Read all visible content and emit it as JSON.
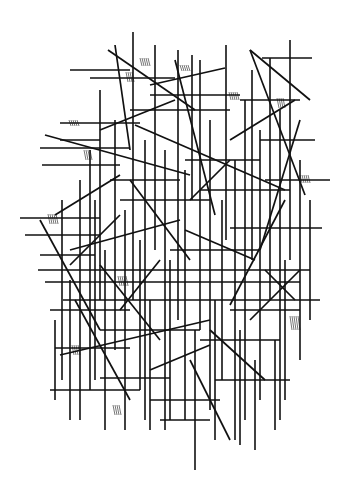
{
  "artwork": {
    "title": "Abstract line drawing",
    "background": "#ffffff",
    "ink": "#111111",
    "hatch": "#555555",
    "width": 347,
    "height": 489,
    "verticals": [
      [
        133,
        32,
        133,
        300
      ],
      [
        155,
        45,
        155,
        250
      ],
      [
        178,
        50,
        178,
        320
      ],
      [
        192,
        55,
        192,
        200
      ],
      [
        200,
        60,
        200,
        330
      ],
      [
        226,
        45,
        226,
        240
      ],
      [
        252,
        70,
        252,
        260
      ],
      [
        270,
        58,
        270,
        300
      ],
      [
        290,
        40,
        290,
        260
      ],
      [
        100,
        90,
        100,
        300
      ],
      [
        115,
        120,
        115,
        350
      ],
      [
        90,
        150,
        90,
        390
      ],
      [
        80,
        180,
        80,
        420
      ],
      [
        62,
        200,
        62,
        380
      ],
      [
        145,
        140,
        145,
        420
      ],
      [
        165,
        150,
        165,
        430
      ],
      [
        185,
        170,
        185,
        420
      ],
      [
        210,
        120,
        210,
        410
      ],
      [
        235,
        160,
        235,
        440
      ],
      [
        245,
        100,
        245,
        420
      ],
      [
        260,
        130,
        260,
        400
      ],
      [
        280,
        110,
        280,
        420
      ],
      [
        300,
        160,
        300,
        360
      ],
      [
        310,
        200,
        310,
        320
      ],
      [
        125,
        210,
        125,
        430
      ],
      [
        105,
        250,
        105,
        430
      ],
      [
        70,
        280,
        70,
        420
      ],
      [
        55,
        320,
        55,
        400
      ],
      [
        215,
        300,
        215,
        440
      ],
      [
        195,
        330,
        195,
        470
      ],
      [
        240,
        330,
        240,
        445
      ],
      [
        275,
        340,
        275,
        430
      ],
      [
        255,
        360,
        255,
        450
      ],
      [
        150,
        300,
        150,
        430
      ],
      [
        170,
        260,
        170,
        420
      ],
      [
        222,
        200,
        222,
        380
      ],
      [
        95,
        200,
        95,
        380
      ],
      [
        140,
        240,
        140,
        390
      ],
      [
        285,
        260,
        285,
        400
      ]
    ],
    "horizontals": [
      [
        70,
        70,
        130,
        70
      ],
      [
        90,
        78,
        175,
        78
      ],
      [
        262,
        58,
        312,
        58
      ],
      [
        40,
        148,
        130,
        148
      ],
      [
        42,
        165,
        120,
        165
      ],
      [
        60,
        123,
        140,
        123
      ],
      [
        60,
        140,
        100,
        140
      ],
      [
        260,
        140,
        315,
        140
      ],
      [
        265,
        180,
        330,
        180
      ],
      [
        20,
        218,
        100,
        218
      ],
      [
        25,
        235,
        100,
        235
      ],
      [
        230,
        228,
        322,
        228
      ],
      [
        40,
        255,
        95,
        255
      ],
      [
        38,
        270,
        310,
        270
      ],
      [
        45,
        282,
        300,
        282
      ],
      [
        63,
        300,
        320,
        300
      ],
      [
        50,
        310,
        130,
        310
      ],
      [
        55,
        348,
        130,
        348
      ],
      [
        100,
        378,
        170,
        378
      ],
      [
        150,
        400,
        220,
        400
      ],
      [
        170,
        250,
        260,
        250
      ],
      [
        120,
        200,
        210,
        200
      ],
      [
        200,
        190,
        290,
        190
      ],
      [
        130,
        110,
        230,
        110
      ],
      [
        150,
        95,
        240,
        95
      ],
      [
        240,
        100,
        300,
        100
      ],
      [
        50,
        390,
        140,
        390
      ],
      [
        160,
        420,
        210,
        420
      ],
      [
        200,
        340,
        280,
        340
      ],
      [
        230,
        310,
        300,
        310
      ],
      [
        100,
        330,
        200,
        330
      ],
      [
        215,
        380,
        290,
        380
      ],
      [
        185,
        160,
        260,
        160
      ],
      [
        110,
        180,
        180,
        180
      ]
    ],
    "diagonals": [
      [
        108,
        50,
        195,
        110
      ],
      [
        115,
        45,
        130,
        150
      ],
      [
        250,
        50,
        310,
        100
      ],
      [
        175,
        60,
        215,
        215
      ],
      [
        135,
        125,
        285,
        190
      ],
      [
        45,
        135,
        190,
        175
      ],
      [
        55,
        215,
        120,
        175
      ],
      [
        40,
        220,
        100,
        330
      ],
      [
        230,
        140,
        295,
        100
      ],
      [
        250,
        50,
        305,
        195
      ],
      [
        150,
        85,
        225,
        68
      ],
      [
        260,
        250,
        300,
        120
      ],
      [
        70,
        250,
        180,
        220
      ],
      [
        130,
        180,
        190,
        260
      ],
      [
        60,
        355,
        210,
        320
      ],
      [
        75,
        300,
        130,
        400
      ],
      [
        230,
        305,
        285,
        200
      ],
      [
        100,
        265,
        160,
        340
      ],
      [
        210,
        330,
        265,
        380
      ],
      [
        120,
        310,
        160,
        260
      ],
      [
        190,
        360,
        230,
        440
      ],
      [
        250,
        320,
        300,
        270
      ],
      [
        150,
        370,
        210,
        345
      ],
      [
        185,
        230,
        255,
        260
      ],
      [
        70,
        265,
        120,
        215
      ],
      [
        100,
        130,
        175,
        100
      ],
      [
        190,
        200,
        230,
        160
      ],
      [
        265,
        270,
        295,
        300
      ]
    ],
    "hatches": [
      [
        140,
        58,
        10,
        8
      ],
      [
        126,
        72,
        8,
        10
      ],
      [
        69,
        120,
        10,
        6
      ],
      [
        84,
        150,
        8,
        10
      ],
      [
        229,
        92,
        10,
        8
      ],
      [
        277,
        98,
        8,
        10
      ],
      [
        48,
        214,
        10,
        10
      ],
      [
        118,
        276,
        10,
        10
      ],
      [
        290,
        316,
        10,
        14
      ],
      [
        72,
        345,
        8,
        10
      ],
      [
        113,
        405,
        8,
        10
      ],
      [
        300,
        175,
        10,
        8
      ],
      [
        180,
        65,
        10,
        6
      ]
    ]
  }
}
